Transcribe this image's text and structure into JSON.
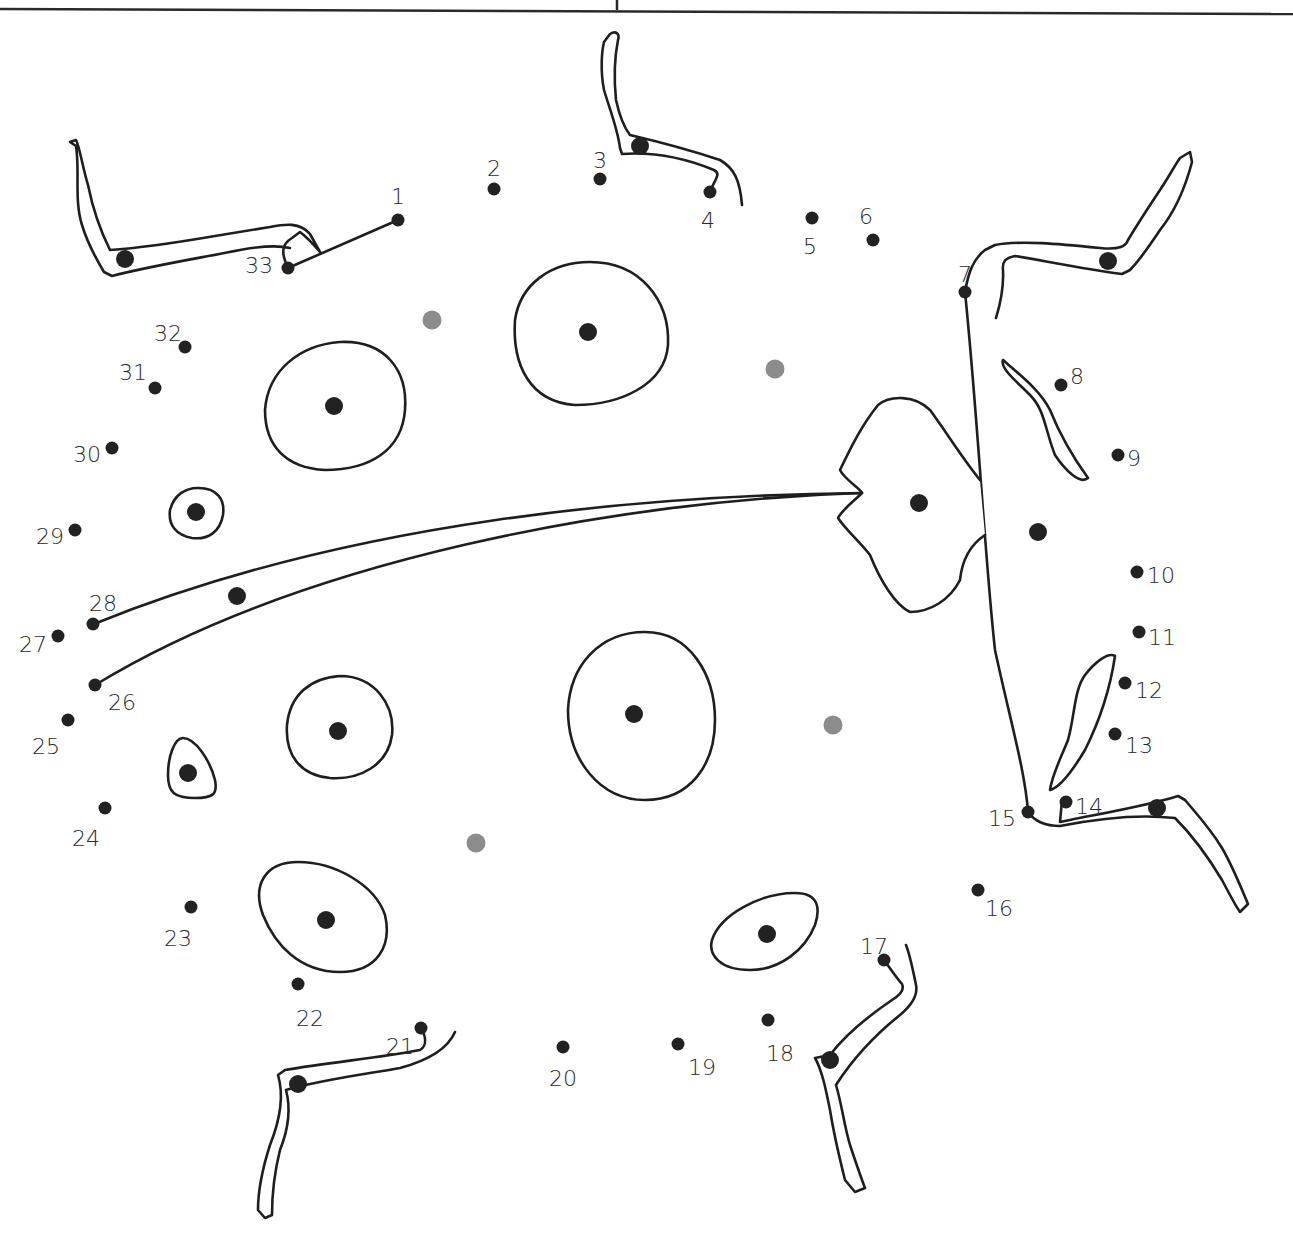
{
  "worksheet": {
    "subject": "ladybug",
    "dot_color": "#222222",
    "hint_dot_color": "#8c8c8c",
    "line_color": "#1e1e1e",
    "numbered_dots": [
      {
        "n": "1"
      },
      {
        "n": "2"
      },
      {
        "n": "3"
      },
      {
        "n": "4"
      },
      {
        "n": "5"
      },
      {
        "n": "6"
      },
      {
        "n": "7"
      },
      {
        "n": "8"
      },
      {
        "n": "9"
      },
      {
        "n": "10"
      },
      {
        "n": "11"
      },
      {
        "n": "12"
      },
      {
        "n": "13"
      },
      {
        "n": "14"
      },
      {
        "n": "15"
      },
      {
        "n": "16"
      },
      {
        "n": "17"
      },
      {
        "n": "18"
      },
      {
        "n": "19"
      },
      {
        "n": "20"
      },
      {
        "n": "21"
      },
      {
        "n": "22"
      },
      {
        "n": "23"
      },
      {
        "n": "24"
      },
      {
        "n": "25"
      },
      {
        "n": "26"
      },
      {
        "n": "27"
      },
      {
        "n": "28"
      },
      {
        "n": "29"
      },
      {
        "n": "30"
      },
      {
        "n": "31"
      },
      {
        "n": "32"
      },
      {
        "n": "33"
      }
    ]
  }
}
